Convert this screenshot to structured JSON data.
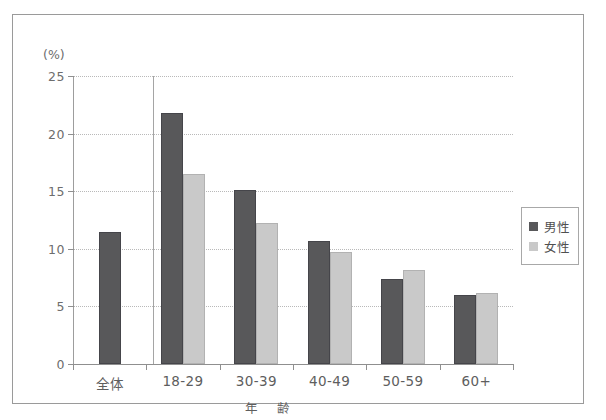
{
  "chart_data": {
    "type": "bar",
    "title": "",
    "subtitle": "",
    "xlabel": "年　齢",
    "ylabel": "(%)",
    "ylim": [
      0,
      25
    ],
    "yticks": [
      0,
      5,
      10,
      15,
      20,
      25
    ],
    "ytick_labels": [
      "0",
      "5",
      "10",
      "15",
      "20",
      "25"
    ],
    "grid": true,
    "legend_position": "right",
    "categories": [
      "全体",
      "18-29",
      "30-39",
      "40-49",
      "50-59",
      "60+"
    ],
    "series": [
      {
        "name": "男性",
        "color": "#58585a",
        "values": [
          11.5,
          21.8,
          15.1,
          10.7,
          7.4,
          6.0
        ]
      },
      {
        "name": "女性",
        "color": "#c9c9c9",
        "values": [
          null,
          16.5,
          12.2,
          9.7,
          8.2,
          6.2
        ]
      }
    ]
  },
  "legend": {
    "items": [
      {
        "label": "男性",
        "swatch": "male"
      },
      {
        "label": "女性",
        "swatch": "female"
      }
    ]
  },
  "axis": {
    "unit_label": "(%)",
    "x_title": "年　齢"
  }
}
